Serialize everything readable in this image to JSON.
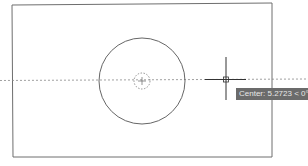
{
  "viewport": {
    "background": "#ffffff"
  },
  "drawing": {
    "rectangle": {
      "x1": 12,
      "y1": 5,
      "x2": 272,
      "y2": 156,
      "stroke": "#6e6e6e"
    },
    "circle": {
      "cx": 142,
      "cy": 80,
      "r": 43,
      "stroke": "#555555"
    },
    "center_marker": {
      "cx": 142,
      "cy": 80,
      "r": 8,
      "stroke": "#777777"
    },
    "tracking_line": {
      "y": 80.5,
      "stroke": "#888888"
    }
  },
  "cursor": {
    "icon": "crosshair-cursor-icon",
    "x": 226,
    "y": 79,
    "vertical": {
      "y1": 57,
      "y2": 100
    },
    "horizontal": {
      "x1": 205,
      "x2": 246
    },
    "color": "#333333"
  },
  "tooltip": {
    "text": "Center: 5.2723 < 0°",
    "background": "#6b6b6b",
    "color": "#e8e8e8"
  }
}
